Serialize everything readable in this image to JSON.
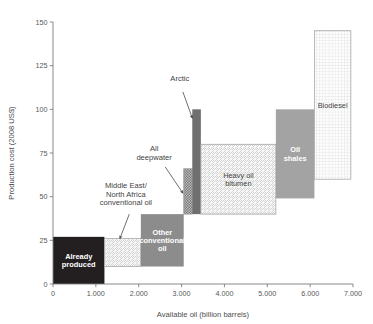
{
  "chart_data": {
    "type": "bar",
    "title": "",
    "subtitle": "",
    "xlabel": "Available oil (billion barrels)",
    "ylabel": "Production cost (2008 US$)",
    "xlim": [
      0,
      7000
    ],
    "ylim": [
      0,
      150
    ],
    "xticks": [
      0,
      1000,
      2000,
      3000,
      4000,
      5000,
      6000,
      7000
    ],
    "xtick_labels": [
      "0",
      "1.000",
      "2.000",
      "3.000",
      "4.000",
      "5.000",
      "6.000",
      "7.000"
    ],
    "yticks": [
      0,
      25,
      50,
      75,
      100,
      125,
      150
    ],
    "ytick_labels": [
      "0",
      "25",
      "50",
      "75",
      "100",
      "125",
      "150"
    ],
    "grid": false,
    "legend": "none",
    "note": "Each resource is drawn as a box: horizontal extent = cumulative available oil range (billion barrels), vertical extent = production cost range (2008 US$ per barrel).",
    "boxes": [
      {
        "name": "Already produced",
        "label": "Already produced",
        "label_lines": [
          "Already",
          "produced"
        ],
        "label_placement": "inside",
        "label_color": "#ffffff",
        "x0": 0,
        "x1": 1200,
        "y0": 0,
        "y1": 27,
        "fill": "#231f20",
        "pattern": "solid"
      },
      {
        "name": "Middle East/North Africa conventional oil",
        "label": "Middle East/ North Africa conventional oil",
        "label_lines": [
          "Middle East/",
          "North Africa",
          "conventional oil"
        ],
        "label_placement": "callout",
        "label_color": "#3f3f3f",
        "x0": 1200,
        "x1": 2050,
        "y0": 10,
        "y1": 26,
        "fill": "#f4f4f4",
        "pattern": "diagonal-hatch"
      },
      {
        "name": "Other conventional oil",
        "label": "Other conventional oil",
        "label_lines": [
          "Other",
          "conventional",
          "oil"
        ],
        "label_placement": "inside",
        "label_color": "#ffffff",
        "x0": 2050,
        "x1": 3050,
        "y0": 10,
        "y1": 40,
        "fill": "#8c8c8c",
        "pattern": "solid"
      },
      {
        "name": "All deepwater",
        "label": "All deepwater",
        "label_lines": [
          "All",
          "deepwater"
        ],
        "label_placement": "callout",
        "label_color": "#3f3f3f",
        "x0": 3050,
        "x1": 3250,
        "y0": 40,
        "y1": 66,
        "fill": "#bdbdbd",
        "pattern": "checker"
      },
      {
        "name": "Arctic",
        "label": "Arctic",
        "label_lines": [
          "Arctic"
        ],
        "label_placement": "callout",
        "label_color": "#3f3f3f",
        "x0": 3250,
        "x1": 3450,
        "y0": 40,
        "y1": 100,
        "fill": "#6f6f6f",
        "pattern": "solid"
      },
      {
        "name": "Heavy oil bitumen",
        "label": "Heavy oil bitumen",
        "label_lines": [
          "Heavy oil",
          "bitumen"
        ],
        "label_placement": "inside",
        "label_color": "#3f3f3f",
        "x0": 3450,
        "x1": 5200,
        "y0": 40,
        "y1": 80,
        "fill": "#f7f7f7",
        "pattern": "diagonal-hatch"
      },
      {
        "name": "Oil shales",
        "label": "Oil shales",
        "label_lines": [
          "Oil",
          "shales"
        ],
        "label_placement": "inside",
        "label_color": "#e8e8e8",
        "x0": 5200,
        "x1": 6100,
        "y0": 49,
        "y1": 100,
        "fill": "#a3a3a3",
        "pattern": "solid"
      },
      {
        "name": "Biodiesel",
        "label": "Biodiesel",
        "label_lines": [
          "Biodiesel"
        ],
        "label_placement": "inside",
        "label_color": "#3f3f3f",
        "x0": 6100,
        "x1": 6950,
        "y0": 60,
        "y1": 145,
        "fill": "#fcfcfc",
        "pattern": "grid"
      }
    ],
    "annotations": [
      {
        "name": "middle-east-north-africa-callout",
        "lines": [
          "Middle East/",
          "North Africa",
          "conventional oil"
        ],
        "text_x": 1700,
        "text_y": 55,
        "arrow_from_x": 1780,
        "arrow_from_y": 40,
        "arrow_to_x": 1560,
        "arrow_to_y": 26
      },
      {
        "name": "all-deepwater-callout",
        "lines": [
          "All",
          "deepwater"
        ],
        "text_x": 2360,
        "text_y": 76,
        "arrow_from_x": 2620,
        "arrow_from_y": 67,
        "arrow_to_x": 3030,
        "arrow_to_y": 52
      },
      {
        "name": "arctic-callout",
        "lines": [
          "Arctic"
        ],
        "text_x": 2960,
        "text_y": 116,
        "arrow_from_x": 3030,
        "arrow_from_y": 110,
        "arrow_to_x": 3250,
        "arrow_to_y": 95
      }
    ]
  },
  "axes": {
    "x_title": "Available oil (billion barrels)",
    "y_title": "Production cost (2008 US$)"
  }
}
